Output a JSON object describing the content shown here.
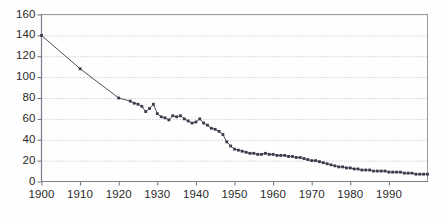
{
  "chart_data": {
    "type": "line",
    "title": "",
    "subtitle": "",
    "xlabel": "",
    "ylabel": "",
    "xlim": [
      1900,
      2000
    ],
    "ylim": [
      0,
      160
    ],
    "yticks": [
      0,
      20,
      40,
      60,
      80,
      100,
      120,
      140,
      160
    ],
    "xticks": [
      1900,
      1910,
      1920,
      1930,
      1940,
      1950,
      1960,
      1970,
      1980,
      1990
    ],
    "ytick_labels": [
      "0",
      "20",
      "40",
      "60",
      "80",
      "100",
      "120",
      "140",
      "160"
    ],
    "xtick_labels": [
      "1900",
      "1910",
      "1920",
      "1930",
      "1940",
      "1950",
      "1960",
      "1970",
      "1980",
      "1990"
    ],
    "grid": true,
    "grid_style": "dotted",
    "legend": null,
    "marker": "square",
    "series": [
      {
        "name": "series-1",
        "color": "#3a3a4a",
        "x": [
          1900,
          1910,
          1920,
          1923,
          1924,
          1925,
          1926,
          1927,
          1928,
          1929,
          1930,
          1931,
          1932,
          1933,
          1934,
          1935,
          1936,
          1937,
          1938,
          1939,
          1940,
          1941,
          1942,
          1943,
          1944,
          1945,
          1946,
          1947,
          1948,
          1949,
          1950,
          1951,
          1952,
          1953,
          1954,
          1955,
          1956,
          1957,
          1958,
          1959,
          1960,
          1961,
          1962,
          1963,
          1964,
          1965,
          1966,
          1967,
          1968,
          1969,
          1970,
          1971,
          1972,
          1973,
          1974,
          1975,
          1976,
          1977,
          1978,
          1979,
          1980,
          1981,
          1982,
          1983,
          1984,
          1985,
          1986,
          1987,
          1988,
          1989,
          1990,
          1991,
          1992,
          1993,
          1994,
          1995,
          1996,
          1997,
          1998,
          1999,
          2000
        ],
        "y": [
          140,
          108,
          80,
          77,
          75,
          74,
          72,
          67,
          70,
          74,
          65,
          62,
          61,
          59,
          63,
          62,
          63,
          60,
          58,
          56,
          57,
          60,
          56,
          54,
          51,
          50,
          48,
          45,
          38,
          34,
          31,
          30,
          29,
          28,
          27,
          27,
          26,
          26,
          27,
          26,
          26,
          25,
          25,
          25,
          24,
          24,
          23,
          23,
          22,
          21,
          20,
          20,
          19,
          18,
          17,
          16,
          15,
          14,
          14,
          13,
          13,
          12,
          12,
          11,
          11,
          11,
          10,
          10,
          10,
          10,
          9,
          9,
          9,
          9,
          8,
          8,
          8,
          7,
          7,
          7,
          7
        ]
      }
    ]
  },
  "axes": {
    "line_color": "#8a8a96",
    "grid_color": "#b9b9c4",
    "tick_color": "#6e6e78"
  }
}
